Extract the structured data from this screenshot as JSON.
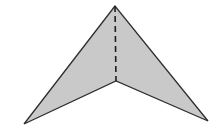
{
  "figure": {
    "shape": "concave quadrilateral (arrowhead / dart)",
    "fill_color": "#c9c9c9",
    "stroke_color": "#2e2e2e",
    "vertices": {
      "top": [
        115,
        6
      ],
      "left": [
        24,
        124
      ],
      "inner": [
        116,
        81
      ],
      "right": [
        208,
        121
      ]
    },
    "fold_line": {
      "style": "dashed",
      "from": [
        115,
        6
      ],
      "to": [
        116,
        81
      ]
    }
  }
}
